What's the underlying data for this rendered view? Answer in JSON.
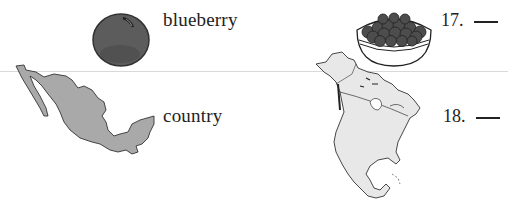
{
  "worksheet": {
    "items": [
      {
        "left_image": "blueberry-icon",
        "word": "blueberry",
        "right_image": "bowl-of-blueberries-icon",
        "number": "17.",
        "answer": ""
      },
      {
        "left_image": "mexico-map-icon",
        "word": "country",
        "right_image": "north-america-map-icon",
        "number": "18.",
        "answer": ""
      }
    ]
  },
  "colors": {
    "blueberry_fill": "#5a5a5a",
    "blueberry_dark": "#3a3a3a",
    "mexico_fill": "#a8a8a8",
    "north_america_fill": "#e6e6e6",
    "outline": "#2a2a2a",
    "divider": "#d9d9d9"
  }
}
